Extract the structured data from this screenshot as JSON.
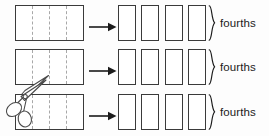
{
  "diagram": {
    "background_color": "#fdfdfd",
    "outline_color": "#3a3a3a",
    "dash_color": "#a8a8a8",
    "rows": [
      {
        "whole_label": "whole-bar",
        "parts": 4,
        "pieces": 4,
        "arrow": "right-arrow",
        "brace": "right-curly-brace",
        "label": "fourths"
      },
      {
        "whole_label": "whole-bar",
        "parts": 4,
        "pieces": 4,
        "arrow": "right-arrow",
        "brace": "right-curly-brace",
        "label": "fourths"
      },
      {
        "whole_label": "whole-bar",
        "parts": 4,
        "pieces": 4,
        "arrow": "right-arrow",
        "brace": "right-curly-brace",
        "label": "fourths"
      }
    ],
    "scissors": {
      "icon": "scissors-icon",
      "description": "scissors cutting the bars"
    }
  }
}
